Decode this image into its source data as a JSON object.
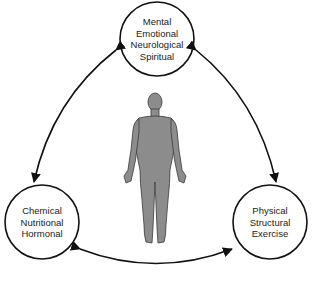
{
  "diagram": {
    "type": "triad-cycle",
    "nodes": [
      {
        "id": "mental",
        "lines": [
          "Mental",
          "Emotional",
          "Neurological",
          "Spiritual"
        ]
      },
      {
        "id": "chemical",
        "lines": [
          "Chemical",
          "Nutritional",
          "Hormonal"
        ]
      },
      {
        "id": "physical",
        "lines": [
          "Physical",
          "Structural",
          "Exercise"
        ]
      }
    ],
    "edges": [
      {
        "from": "mental",
        "to": "chemical",
        "direction": "bidirectional"
      },
      {
        "from": "mental",
        "to": "physical",
        "direction": "bidirectional"
      },
      {
        "from": "chemical",
        "to": "physical",
        "direction": "bidirectional"
      }
    ],
    "center_figure": "human-body-silhouette",
    "colors": {
      "stroke": "#111111",
      "figure_fill": "#8c8c8c",
      "figure_stroke": "#3a3a3a"
    }
  }
}
